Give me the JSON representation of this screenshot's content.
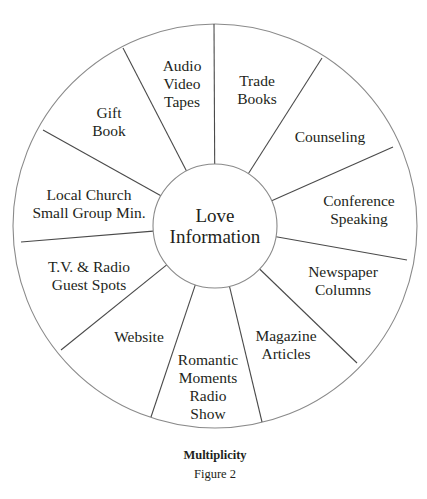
{
  "diagram": {
    "hub": {
      "label": "Love\nInformation"
    },
    "segments": [
      {
        "label": "Audio\nVideo\nTapes",
        "x": 182,
        "y": 84
      },
      {
        "label": "Trade\nBooks",
        "x": 257,
        "y": 90
      },
      {
        "label": "Counseling",
        "x": 330,
        "y": 137
      },
      {
        "label": "Conference\nSpeaking",
        "x": 359,
        "y": 210
      },
      {
        "label": "Newspaper\nColumns",
        "x": 343,
        "y": 281
      },
      {
        "label": "Magazine\nArticles",
        "x": 286,
        "y": 345
      },
      {
        "label": "Romantic\nMoments\nRadio\nShow",
        "x": 208,
        "y": 387
      },
      {
        "label": "Website",
        "x": 139,
        "y": 337
      },
      {
        "label": "T.V. & Radio\nGuest Spots",
        "x": 89,
        "y": 276
      },
      {
        "label": "Local Church\nSmall Group Min.",
        "x": 89,
        "y": 204
      },
      {
        "label": "Gift\nBook",
        "x": 109,
        "y": 122
      }
    ],
    "spokes": [
      [
        214,
        24
      ],
      [
        322,
        58
      ],
      [
        393,
        147
      ],
      [
        407,
        260
      ],
      [
        357,
        363
      ],
      [
        262,
        422
      ],
      [
        151,
        417
      ],
      [
        61,
        350
      ],
      [
        21,
        242
      ],
      [
        43,
        130
      ],
      [
        123,
        48
      ]
    ],
    "center": [
      215,
      226
    ],
    "outer_radius": 202,
    "inner_radius": 62,
    "line_color": "#8a8a8a",
    "spoke_color": "#4a4a4a"
  },
  "caption": {
    "title": "Multiplicity",
    "figure": "Figure 2"
  }
}
